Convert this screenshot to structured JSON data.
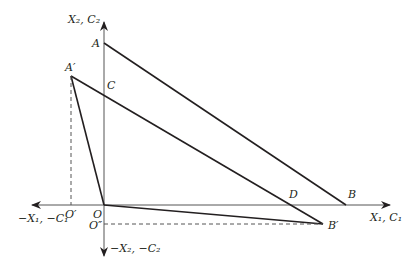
{
  "diagram": {
    "type": "geometric-axes-diagram",
    "axes": {
      "x_positive": "X₁, C₁",
      "x_negative": "−X₁, −C₁",
      "y_positive": "X₂, C₂",
      "y_negative": "−X₂, −C₂"
    },
    "points": {
      "A": "A",
      "A_prime": "A′",
      "B": "B",
      "B_prime": "B′",
      "C": "C",
      "D": "D",
      "O": "O",
      "O_prime": "O′",
      "O_double_prime": "O″"
    },
    "segments": [
      {
        "from": "A",
        "to": "B",
        "style": "solid"
      },
      {
        "from": "A′",
        "to": "D",
        "style": "solid"
      },
      {
        "from": "A′",
        "to": "O",
        "style": "solid"
      },
      {
        "from": "O",
        "to": "B′",
        "style": "solid"
      },
      {
        "from": "D",
        "to": "B′",
        "style": "solid"
      },
      {
        "from": "A′",
        "to": "O′",
        "style": "dashed"
      },
      {
        "from": "O″",
        "to": "B′",
        "style": "dashed"
      }
    ],
    "colors": {
      "line": "#231f20",
      "axis": "#555555",
      "background": "#ffffff"
    }
  }
}
